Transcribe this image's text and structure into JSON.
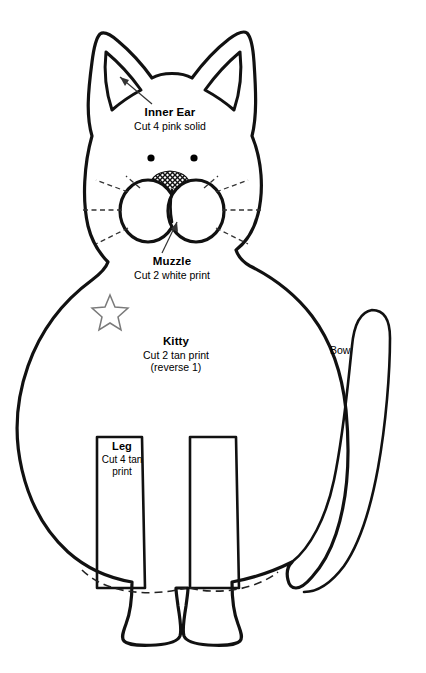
{
  "document": {
    "title": "Kitty Sewing Pattern",
    "background_color": "#ffffff",
    "ink_color": "#111111",
    "width": 426,
    "height": 673
  },
  "labels": {
    "inner_ear": {
      "title": "Inner Ear",
      "instruction": "Cut 4 pink solid"
    },
    "muzzle": {
      "title": "Muzzle",
      "instruction": "Cut 2 white print"
    },
    "kitty": {
      "title": "Kitty",
      "instruction": "Cut 2 tan print",
      "note": "(reverse 1)"
    },
    "leg": {
      "title": "Leg",
      "instruction_line1": "Cut 4 tan",
      "instruction_line2": "print"
    },
    "bow": {
      "title": "Bow"
    }
  },
  "pieces": [
    {
      "name": "kitty-body",
      "label": "Kitty",
      "cut": "Cut 2 tan print",
      "note": "(reverse 1)"
    },
    {
      "name": "inner-ear",
      "label": "Inner Ear",
      "cut": "Cut 4 pink solid"
    },
    {
      "name": "muzzle",
      "label": "Muzzle",
      "cut": "Cut 2 white print"
    },
    {
      "name": "leg",
      "label": "Leg",
      "cut": "Cut 4 tan print"
    },
    {
      "name": "bow",
      "label": "Bow",
      "cut": ""
    }
  ],
  "markings": {
    "star": "placement-star",
    "eyes": 2,
    "whiskers_per_side": 3,
    "foot_seam": "dashed"
  }
}
